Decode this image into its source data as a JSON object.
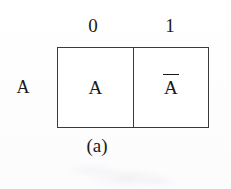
{
  "figure": {
    "caption": "(a)",
    "row_label": "A",
    "column_headers": [
      "0",
      "1"
    ],
    "cells": [
      {
        "id": "cell-0",
        "value": "A",
        "complement": false
      },
      {
        "id": "cell-1",
        "value": "A",
        "complement": true
      }
    ],
    "cell_display": {
      "left": "A",
      "right": "A"
    },
    "colors": {
      "background": "#fdfdfd",
      "cell_fill": "#ffffff",
      "line": "#3a3a3e",
      "text": "#1a1a1a"
    }
  }
}
